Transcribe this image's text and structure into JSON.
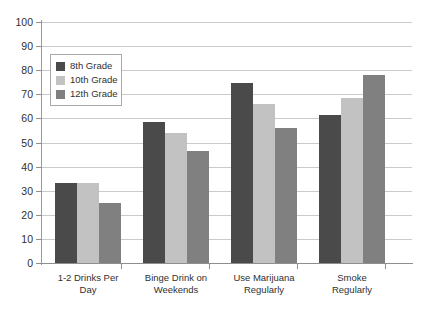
{
  "chart_data": {
    "type": "bar",
    "title": "",
    "xlabel": "",
    "ylabel": "",
    "ylim": [
      0,
      100
    ],
    "ytick_step": 10,
    "grid": true,
    "legend_position": "upper-left-inside",
    "categories": [
      "1-2 Drinks Per Day",
      "Binge Drink on Weekends",
      "Use Marijuana Regularly",
      "Smoke Regularly"
    ],
    "category_lines": [
      [
        "1-2 Drinks Per",
        "Day"
      ],
      [
        "Binge Drink on",
        "Weekends"
      ],
      [
        "Use Marijuana",
        "Regularly"
      ],
      [
        "Smoke",
        "Regularly"
      ]
    ],
    "yticks": [
      "0",
      "10",
      "20",
      "30",
      "40",
      "50",
      "60",
      "70",
      "80",
      "90",
      "100"
    ],
    "series": [
      {
        "name": "8th Grade",
        "color": "#4a4a4a",
        "values": [
          33,
          58.5,
          74.5,
          61.5
        ]
      },
      {
        "name": "10th Grade",
        "color": "#c2c2c2",
        "values": [
          33,
          54,
          66,
          68.5
        ]
      },
      {
        "name": "12th Grade",
        "color": "#808080",
        "values": [
          25,
          46.5,
          56,
          78
        ]
      }
    ]
  },
  "colors": {
    "background": "#ffffff",
    "gridline": "#cbcbcb",
    "axis": "#8e8e8e",
    "text": "#303030",
    "legend_border": "#a8a8a8"
  }
}
